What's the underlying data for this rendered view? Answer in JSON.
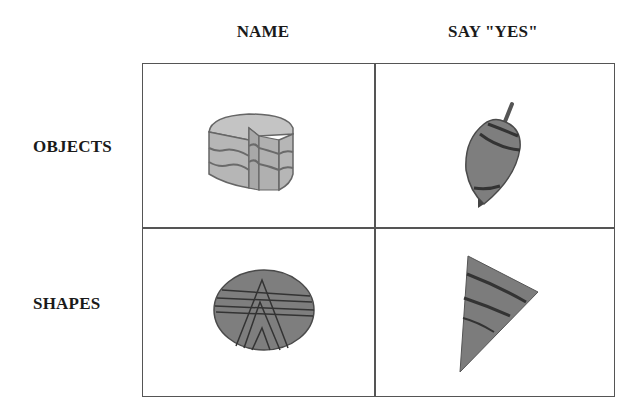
{
  "columns": [
    {
      "label": "NAME"
    },
    {
      "label": "SAY \"YES\""
    }
  ],
  "rows": [
    {
      "label": "OBJECTS"
    },
    {
      "label": "SHAPES"
    }
  ],
  "cells": [
    {
      "row": "OBJECTS",
      "column": "NAME",
      "icon": "cake-icon"
    },
    {
      "row": "OBJECTS",
      "column": "SAY \"YES\"",
      "icon": "spinning-top-icon"
    },
    {
      "row": "SHAPES",
      "column": "NAME",
      "icon": "striped-oval-icon"
    },
    {
      "row": "SHAPES",
      "column": "SAY \"YES\"",
      "icon": "striped-triangle-icon"
    }
  ],
  "colors": {
    "grid_line": "#555555",
    "light_fill": "#b8b8b8",
    "dark_fill": "#7a7a7a",
    "stroke": "#3a3a3a"
  }
}
